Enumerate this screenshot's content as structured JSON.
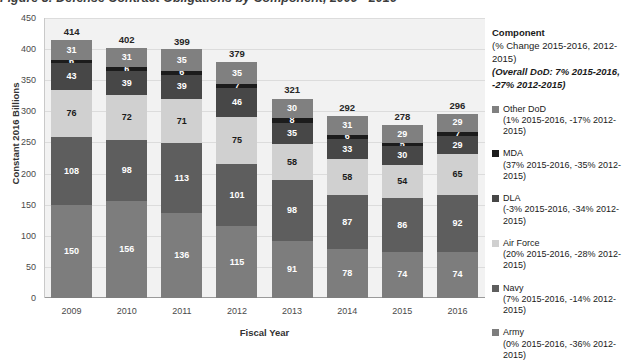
{
  "figure": {
    "title": "Figure 3: Defense Contract Obligations by Component, 2009 - 2016"
  },
  "legend": {
    "header": "Component",
    "subheader": "(% Change 2015-2016, 2012-2015)",
    "overall": "(Overall DoD: 7% 2015-2016, -27% 2012-2015)",
    "items": [
      {
        "label": "Other DoD",
        "note": "(1% 2015-2016, -17% 2012-2015)",
        "color": "#808080"
      },
      {
        "label": "MDA",
        "note": "(37% 2015-2016, -35% 2012-2015)",
        "color": "#1c1c1c"
      },
      {
        "label": "DLA",
        "note": "(-3% 2015-2016, -34% 2012-2015)",
        "color": "#474747"
      },
      {
        "label": "Air Force",
        "note": "(20% 2015-2016, -28% 2012-2015)",
        "color": "#d0d0d0"
      },
      {
        "label": "Navy",
        "note": "(7% 2015-2016, -14% 2012-2015)",
        "color": "#5e5e5e"
      },
      {
        "label": "Army",
        "note": "(0% 2015-2016, -36% 2012-2015)",
        "color": "#7d7d7d"
      }
    ]
  },
  "chart_data": {
    "type": "bar",
    "stacked": true,
    "title": "Figure 3: Defense Contract Obligations by Component, 2009 - 2016",
    "xlabel": "Fiscal Year",
    "ylabel": "Constant 2016 Billions",
    "ylim": [
      0,
      450
    ],
    "yticks": [
      0,
      50,
      100,
      150,
      200,
      250,
      300,
      350,
      400,
      450
    ],
    "grid": true,
    "legend_position": "right",
    "categories": [
      "2009",
      "2010",
      "2011",
      "2012",
      "2013",
      "2014",
      "2015",
      "2016"
    ],
    "totals": [
      414,
      402,
      399,
      379,
      321,
      292,
      278,
      296
    ],
    "series": [
      {
        "name": "Army",
        "color": "#7d7d7d",
        "text": "#ffffff",
        "values": [
          150,
          156,
          136,
          115,
          91,
          78,
          74,
          74
        ]
      },
      {
        "name": "Navy",
        "color": "#5e5e5e",
        "text": "#ffffff",
        "values": [
          108,
          98,
          113,
          101,
          98,
          87,
          86,
          92
        ]
      },
      {
        "name": "Air Force",
        "color": "#d0d0d0",
        "text": "#1a1a1a",
        "values": [
          76,
          72,
          71,
          75,
          58,
          58,
          54,
          65
        ]
      },
      {
        "name": "DLA",
        "color": "#474747",
        "text": "#ffffff",
        "values": [
          43,
          39,
          39,
          46,
          35,
          33,
          30,
          29
        ]
      },
      {
        "name": "MDA",
        "color": "#1c1c1c",
        "text": "#ffffff",
        "values": [
          6,
          6,
          6,
          7,
          8,
          6,
          5,
          7
        ]
      },
      {
        "name": "Other DoD",
        "color": "#808080",
        "text": "#ffffff",
        "values": [
          31,
          31,
          35,
          35,
          30,
          31,
          29,
          29
        ]
      }
    ]
  }
}
